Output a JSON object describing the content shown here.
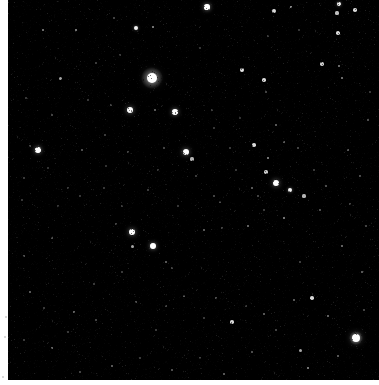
{
  "view": {
    "title": "Star Field Image",
    "alt_text": "Astronomical wide-field exposure of a dense star field on black sky",
    "canvas_width": 379,
    "canvas_height": 385,
    "sky_origin_x": 8,
    "sky_origin_y": 0,
    "sky_width": 371,
    "sky_height": 380,
    "background_color": "#000000",
    "matte_color": "#ffffff",
    "star_color": "#ffffff"
  },
  "chart_data": {
    "type": "scatter",
    "xlabel": "",
    "ylabel": "",
    "xlim": [
      0,
      371
    ],
    "ylim": [
      0,
      380
    ],
    "grid": false,
    "legend": null,
    "point_color": "#ffffff",
    "series": [
      {
        "name": "stars",
        "note": "x,y in sky-local pixels; r = radius px; b = brightness 0-1",
        "points": [
          {
            "x": 35,
            "y": 30,
            "r": 1.1,
            "b": 0.55
          },
          {
            "x": 68,
            "y": 30,
            "r": 1.2,
            "b": 0.6
          },
          {
            "x": 128,
            "y": 28,
            "r": 2.0,
            "b": 0.95
          },
          {
            "x": 145,
            "y": 27,
            "r": 1.3,
            "b": 0.6
          },
          {
            "x": 199,
            "y": 7,
            "r": 2.6,
            "b": 1.0
          },
          {
            "x": 266,
            "y": 11,
            "r": 1.9,
            "b": 0.85
          },
          {
            "x": 283,
            "y": 7,
            "r": 1.4,
            "b": 0.7
          },
          {
            "x": 331,
            "y": 4,
            "r": 2.0,
            "b": 0.95
          },
          {
            "x": 329,
            "y": 13,
            "r": 1.6,
            "b": 0.75
          },
          {
            "x": 347,
            "y": 10,
            "r": 1.8,
            "b": 0.85
          },
          {
            "x": 106,
            "y": 18,
            "r": 0.8,
            "b": 0.3
          },
          {
            "x": 260,
            "y": 36,
            "r": 0.8,
            "b": 0.28
          },
          {
            "x": 330,
            "y": 33,
            "r": 1.8,
            "b": 0.85
          },
          {
            "x": 291,
            "y": 30,
            "r": 0.8,
            "b": 0.25
          },
          {
            "x": 144,
            "y": 78,
            "r": 5.2,
            "b": 1.0,
            "halo": 11
          },
          {
            "x": 52,
            "y": 78,
            "r": 1.5,
            "b": 0.65
          },
          {
            "x": 234,
            "y": 70,
            "r": 1.9,
            "b": 0.9
          },
          {
            "x": 256,
            "y": 80,
            "r": 1.8,
            "b": 0.85
          },
          {
            "x": 314,
            "y": 64,
            "r": 1.7,
            "b": 0.8
          },
          {
            "x": 331,
            "y": 66,
            "r": 1.3,
            "b": 0.55
          },
          {
            "x": 334,
            "y": 78,
            "r": 1.3,
            "b": 0.55
          },
          {
            "x": 112,
            "y": 55,
            "r": 0.9,
            "b": 0.3
          },
          {
            "x": 88,
            "y": 63,
            "r": 0.9,
            "b": 0.3
          },
          {
            "x": 192,
            "y": 48,
            "r": 0.8,
            "b": 0.25
          },
          {
            "x": 122,
            "y": 110,
            "r": 3.0,
            "b": 1.0
          },
          {
            "x": 103,
            "y": 105,
            "r": 1.0,
            "b": 0.35
          },
          {
            "x": 147,
            "y": 110,
            "r": 1.2,
            "b": 0.45
          },
          {
            "x": 167,
            "y": 112,
            "r": 2.7,
            "b": 1.0
          },
          {
            "x": 204,
            "y": 110,
            "r": 0.9,
            "b": 0.3
          },
          {
            "x": 258,
            "y": 92,
            "r": 1.0,
            "b": 0.35
          },
          {
            "x": 97,
            "y": 135,
            "r": 0.9,
            "b": 0.3
          },
          {
            "x": 44,
            "y": 115,
            "r": 1.0,
            "b": 0.35
          },
          {
            "x": 268,
            "y": 125,
            "r": 1.2,
            "b": 0.45
          },
          {
            "x": 30,
            "y": 150,
            "r": 2.8,
            "b": 1.0
          },
          {
            "x": 22,
            "y": 146,
            "r": 1.0,
            "b": 0.35
          },
          {
            "x": 74,
            "y": 150,
            "r": 1.1,
            "b": 0.4
          },
          {
            "x": 120,
            "y": 152,
            "r": 1.0,
            "b": 0.35
          },
          {
            "x": 178,
            "y": 152,
            "r": 3.0,
            "b": 1.0
          },
          {
            "x": 184,
            "y": 159,
            "r": 1.6,
            "b": 0.7
          },
          {
            "x": 156,
            "y": 148,
            "r": 1.0,
            "b": 0.35
          },
          {
            "x": 222,
            "y": 148,
            "r": 1.0,
            "b": 0.3
          },
          {
            "x": 246,
            "y": 145,
            "r": 1.8,
            "b": 0.85
          },
          {
            "x": 260,
            "y": 158,
            "r": 1.4,
            "b": 0.6
          },
          {
            "x": 276,
            "y": 142,
            "r": 1.2,
            "b": 0.45
          },
          {
            "x": 290,
            "y": 148,
            "r": 1.0,
            "b": 0.35
          },
          {
            "x": 258,
            "y": 172,
            "r": 1.7,
            "b": 0.8
          },
          {
            "x": 268,
            "y": 183,
            "r": 3.1,
            "b": 1.0
          },
          {
            "x": 282,
            "y": 190,
            "r": 2.1,
            "b": 0.95
          },
          {
            "x": 244,
            "y": 188,
            "r": 1.2,
            "b": 0.45
          },
          {
            "x": 250,
            "y": 196,
            "r": 1.0,
            "b": 0.35
          },
          {
            "x": 306,
            "y": 170,
            "r": 1.0,
            "b": 0.3
          },
          {
            "x": 318,
            "y": 186,
            "r": 1.1,
            "b": 0.4
          },
          {
            "x": 340,
            "y": 150,
            "r": 1.2,
            "b": 0.45
          },
          {
            "x": 352,
            "y": 176,
            "r": 1.1,
            "b": 0.4
          },
          {
            "x": 16,
            "y": 178,
            "r": 1.0,
            "b": 0.3
          },
          {
            "x": 60,
            "y": 188,
            "r": 1.0,
            "b": 0.3
          },
          {
            "x": 188,
            "y": 176,
            "r": 0.9,
            "b": 0.3
          },
          {
            "x": 206,
            "y": 196,
            "r": 1.0,
            "b": 0.35
          },
          {
            "x": 114,
            "y": 206,
            "r": 0.9,
            "b": 0.3
          },
          {
            "x": 124,
            "y": 232,
            "r": 3.0,
            "b": 1.0
          },
          {
            "x": 145,
            "y": 246,
            "r": 2.9,
            "b": 1.0
          },
          {
            "x": 124,
            "y": 246,
            "r": 1.5,
            "b": 0.65
          },
          {
            "x": 108,
            "y": 224,
            "r": 1.0,
            "b": 0.35
          },
          {
            "x": 158,
            "y": 262,
            "r": 1.2,
            "b": 0.45
          },
          {
            "x": 164,
            "y": 268,
            "r": 1.0,
            "b": 0.35
          },
          {
            "x": 44,
            "y": 238,
            "r": 1.1,
            "b": 0.4
          },
          {
            "x": 114,
            "y": 272,
            "r": 1.0,
            "b": 0.3
          },
          {
            "x": 86,
            "y": 284,
            "r": 1.0,
            "b": 0.3
          },
          {
            "x": 196,
            "y": 230,
            "r": 1.2,
            "b": 0.45
          },
          {
            "x": 214,
            "y": 228,
            "r": 1.0,
            "b": 0.35
          },
          {
            "x": 212,
            "y": 202,
            "r": 1.1,
            "b": 0.4
          },
          {
            "x": 240,
            "y": 226,
            "r": 1.3,
            "b": 0.5
          },
          {
            "x": 256,
            "y": 210,
            "r": 1.0,
            "b": 0.3
          },
          {
            "x": 276,
            "y": 218,
            "r": 1.4,
            "b": 0.6
          },
          {
            "x": 296,
            "y": 196,
            "r": 1.6,
            "b": 0.7
          },
          {
            "x": 312,
            "y": 210,
            "r": 1.1,
            "b": 0.4
          },
          {
            "x": 334,
            "y": 246,
            "r": 1.3,
            "b": 0.5
          },
          {
            "x": 342,
            "y": 204,
            "r": 1.0,
            "b": 0.35
          },
          {
            "x": 16,
            "y": 256,
            "r": 1.1,
            "b": 0.4
          },
          {
            "x": 22,
            "y": 292,
            "r": 1.2,
            "b": 0.45
          },
          {
            "x": 36,
            "y": 308,
            "r": 1.0,
            "b": 0.3
          },
          {
            "x": 66,
            "y": 312,
            "r": 1.3,
            "b": 0.5
          },
          {
            "x": 88,
            "y": 320,
            "r": 1.0,
            "b": 0.35
          },
          {
            "x": 128,
            "y": 302,
            "r": 1.1,
            "b": 0.4
          },
          {
            "x": 158,
            "y": 306,
            "r": 1.0,
            "b": 0.35
          },
          {
            "x": 176,
            "y": 296,
            "r": 1.2,
            "b": 0.45
          },
          {
            "x": 196,
            "y": 318,
            "r": 1.0,
            "b": 0.3
          },
          {
            "x": 208,
            "y": 298,
            "r": 1.1,
            "b": 0.4
          },
          {
            "x": 224,
            "y": 322,
            "r": 1.8,
            "b": 0.85
          },
          {
            "x": 238,
            "y": 306,
            "r": 1.0,
            "b": 0.3
          },
          {
            "x": 256,
            "y": 314,
            "r": 1.2,
            "b": 0.45
          },
          {
            "x": 268,
            "y": 330,
            "r": 1.0,
            "b": 0.35
          },
          {
            "x": 286,
            "y": 300,
            "r": 1.2,
            "b": 0.45
          },
          {
            "x": 304,
            "y": 298,
            "r": 1.8,
            "b": 0.85
          },
          {
            "x": 320,
            "y": 316,
            "r": 1.3,
            "b": 0.5
          },
          {
            "x": 348,
            "y": 338,
            "r": 4.0,
            "b": 1.0,
            "halo": 7
          },
          {
            "x": 356,
            "y": 310,
            "r": 1.0,
            "b": 0.35
          },
          {
            "x": 292,
            "y": 350,
            "r": 1.5,
            "b": 0.65
          },
          {
            "x": 300,
            "y": 368,
            "r": 1.4,
            "b": 0.6
          },
          {
            "x": 330,
            "y": 356,
            "r": 1.2,
            "b": 0.45
          },
          {
            "x": 244,
            "y": 352,
            "r": 1.1,
            "b": 0.4
          },
          {
            "x": 192,
            "y": 358,
            "r": 1.0,
            "b": 0.35
          },
          {
            "x": 216,
            "y": 374,
            "r": 1.2,
            "b": 0.45
          },
          {
            "x": 164,
            "y": 370,
            "r": 1.1,
            "b": 0.4
          },
          {
            "x": 132,
            "y": 358,
            "r": 1.0,
            "b": 0.3
          },
          {
            "x": 104,
            "y": 366,
            "r": 1.2,
            "b": 0.45
          },
          {
            "x": 72,
            "y": 372,
            "r": 1.0,
            "b": 0.35
          },
          {
            "x": 44,
            "y": 348,
            "r": 1.3,
            "b": 0.5
          },
          {
            "x": 16,
            "y": 340,
            "r": 1.0,
            "b": 0.3
          },
          {
            "x": 60,
            "y": 332,
            "r": 1.0,
            "b": 0.3
          },
          {
            "x": 148,
            "y": 330,
            "r": 1.0,
            "b": 0.3
          },
          {
            "x": 14,
            "y": 200,
            "r": 0.9,
            "b": 0.28
          },
          {
            "x": 50,
            "y": 206,
            "r": 0.9,
            "b": 0.28
          },
          {
            "x": 72,
            "y": 196,
            "r": 0.9,
            "b": 0.28
          },
          {
            "x": 96,
            "y": 188,
            "r": 0.9,
            "b": 0.28
          },
          {
            "x": 140,
            "y": 190,
            "r": 0.9,
            "b": 0.3
          },
          {
            "x": 170,
            "y": 206,
            "r": 0.9,
            "b": 0.28
          },
          {
            "x": 228,
            "y": 170,
            "r": 0.9,
            "b": 0.28
          },
          {
            "x": 292,
            "y": 262,
            "r": 1.0,
            "b": 0.32
          },
          {
            "x": 354,
            "y": 272,
            "r": 1.2,
            "b": 0.45
          },
          {
            "x": 358,
            "y": 226,
            "r": 1.0,
            "b": 0.35
          },
          {
            "x": 360,
            "y": 120,
            "r": 1.1,
            "b": 0.4
          },
          {
            "x": 362,
            "y": 92,
            "r": 1.0,
            "b": 0.3
          },
          {
            "x": 18,
            "y": 98,
            "r": 0.9,
            "b": 0.28
          },
          {
            "x": 80,
            "y": 100,
            "r": 0.9,
            "b": 0.28
          },
          {
            "x": 206,
            "y": 128,
            "r": 0.9,
            "b": 0.28
          },
          {
            "x": 232,
            "y": 118,
            "r": 0.9,
            "b": 0.25
          },
          {
            "x": 150,
            "y": 170,
            "r": 0.9,
            "b": 0.28
          },
          {
            "x": 40,
            "y": 168,
            "r": 0.9,
            "b": 0.25
          },
          {
            "x": 98,
            "y": 166,
            "r": 0.9,
            "b": 0.25
          }
        ]
      }
    ]
  }
}
